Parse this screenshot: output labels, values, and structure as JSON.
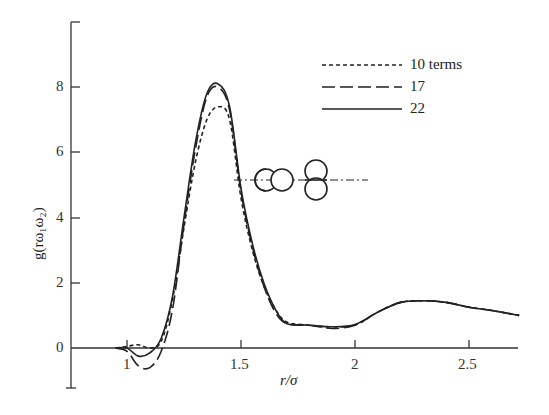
{
  "chart_data": {
    "type": "line",
    "title": "",
    "xlabel": "r/σ",
    "ylabel": "g(rω1ω2)",
    "xlim": [
      0.75,
      2.72
    ],
    "ylim": [
      -1.2,
      10
    ],
    "x_ticks": [
      "1",
      "1.5",
      "2",
      "2.5"
    ],
    "y_ticks": [
      "0",
      "2",
      "4",
      "6",
      "8"
    ],
    "grid": false,
    "legend_position": "upper right",
    "series": [
      {
        "name": "10 terms",
        "style": "short-dash",
        "x": [
          0.95,
          1.0,
          1.05,
          1.1,
          1.15,
          1.2,
          1.25,
          1.3,
          1.35,
          1.4,
          1.45,
          1.5,
          1.55,
          1.6,
          1.65,
          1.7,
          1.8,
          1.9,
          2.0,
          2.1,
          2.2,
          2.3,
          2.4,
          2.5,
          2.6,
          2.72
        ],
        "y": [
          0.0,
          0.05,
          0.1,
          0.0,
          0.2,
          1.5,
          3.7,
          5.7,
          7.0,
          7.4,
          7.0,
          4.6,
          3.0,
          1.9,
          1.2,
          0.8,
          0.7,
          0.65,
          0.7,
          1.1,
          1.4,
          1.45,
          1.4,
          1.25,
          1.15,
          1.0
        ]
      },
      {
        "name": "17",
        "style": "long-dash",
        "x": [
          0.95,
          1.0,
          1.05,
          1.1,
          1.15,
          1.2,
          1.25,
          1.3,
          1.35,
          1.4,
          1.45,
          1.5,
          1.55,
          1.6,
          1.65,
          1.7,
          1.8,
          1.9,
          2.0,
          2.1,
          2.2,
          2.3,
          2.4,
          2.5,
          2.6,
          2.72
        ],
        "y": [
          0.0,
          -0.1,
          -0.55,
          -0.6,
          -0.1,
          1.2,
          3.8,
          6.1,
          7.7,
          8.0,
          7.3,
          4.8,
          3.1,
          1.9,
          1.1,
          0.75,
          0.7,
          0.6,
          0.7,
          1.1,
          1.4,
          1.45,
          1.4,
          1.25,
          1.15,
          1.0
        ]
      },
      {
        "name": "22",
        "style": "solid",
        "x": [
          0.95,
          1.0,
          1.05,
          1.1,
          1.15,
          1.2,
          1.25,
          1.3,
          1.35,
          1.4,
          1.45,
          1.5,
          1.55,
          1.6,
          1.65,
          1.7,
          1.8,
          1.9,
          2.0,
          2.1,
          2.2,
          2.3,
          2.4,
          2.5,
          2.6,
          2.72
        ],
        "y": [
          0.0,
          0.0,
          -0.25,
          -0.15,
          0.3,
          1.6,
          4.0,
          6.3,
          7.8,
          8.1,
          7.4,
          4.9,
          3.2,
          2.0,
          1.2,
          0.75,
          0.7,
          0.65,
          0.72,
          1.1,
          1.4,
          1.45,
          1.4,
          1.25,
          1.15,
          1.0
        ]
      }
    ],
    "annotations": [
      "inset: two dumbbell molecules (one horizontal, one vertical) on dash-dot axis"
    ]
  },
  "legend": {
    "l0": "10 terms",
    "l1": "17",
    "l2": "22"
  },
  "axes": {
    "xlabel": "r/σ",
    "ylabel": "g(rω₁ω₂)",
    "xt": [
      "1",
      "1.5",
      "2",
      "2.5"
    ],
    "yt": [
      "0",
      "2",
      "4",
      "6",
      "8"
    ]
  }
}
